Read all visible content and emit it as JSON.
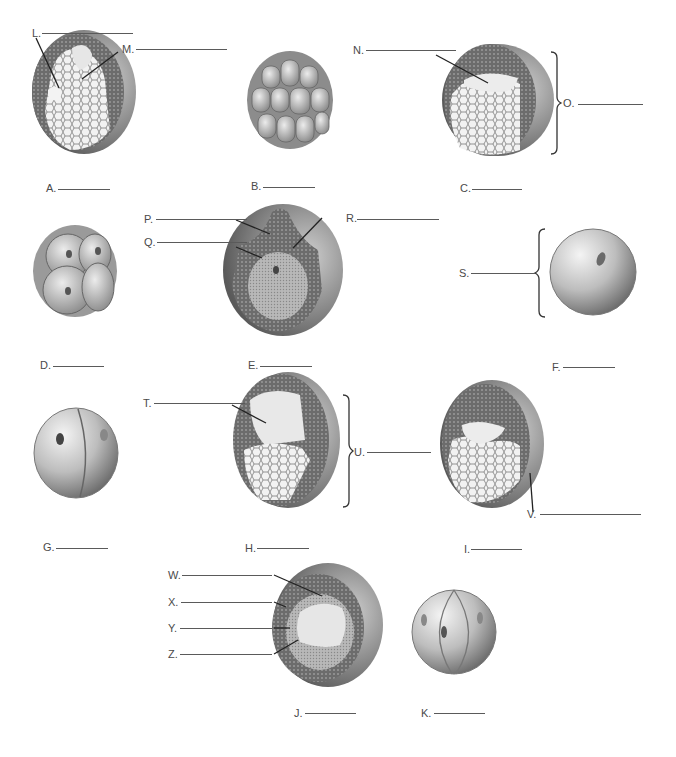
{
  "diagram": {
    "stage_labels": [
      {
        "id": "A",
        "text": "A."
      },
      {
        "id": "B",
        "text": "B."
      },
      {
        "id": "C",
        "text": "C."
      },
      {
        "id": "D",
        "text": "D."
      },
      {
        "id": "E",
        "text": "E."
      },
      {
        "id": "F",
        "text": "F."
      },
      {
        "id": "G",
        "text": "G."
      },
      {
        "id": "H",
        "text": "H."
      },
      {
        "id": "I",
        "text": "I."
      },
      {
        "id": "J",
        "text": "J."
      },
      {
        "id": "K",
        "text": "K."
      }
    ],
    "part_labels": [
      {
        "id": "L",
        "text": "L."
      },
      {
        "id": "M",
        "text": "M."
      },
      {
        "id": "N",
        "text": "N."
      },
      {
        "id": "O",
        "text": "O."
      },
      {
        "id": "P",
        "text": "P."
      },
      {
        "id": "Q",
        "text": "Q."
      },
      {
        "id": "R",
        "text": "R."
      },
      {
        "id": "S",
        "text": "S."
      },
      {
        "id": "T",
        "text": "T."
      },
      {
        "id": "U",
        "text": "U."
      },
      {
        "id": "V",
        "text": "V."
      },
      {
        "id": "W",
        "text": "W."
      },
      {
        "id": "X",
        "text": "X."
      },
      {
        "id": "Y",
        "text": "Y."
      },
      {
        "id": "Z",
        "text": "Z."
      }
    ],
    "illustrations": [
      {
        "stage": "A",
        "name": "gastrula-late"
      },
      {
        "stage": "B",
        "name": "morula"
      },
      {
        "stage": "C",
        "name": "blastula-section"
      },
      {
        "stage": "D",
        "name": "eight-cell-stage"
      },
      {
        "stage": "E",
        "name": "neurula-section"
      },
      {
        "stage": "F",
        "name": "zygote"
      },
      {
        "stage": "G",
        "name": "two-cell-stage"
      },
      {
        "stage": "H",
        "name": "early-gastrula-section"
      },
      {
        "stage": "I",
        "name": "gastrula-section"
      },
      {
        "stage": "J",
        "name": "late-neurula-section"
      },
      {
        "stage": "K",
        "name": "four-cell-stage"
      }
    ]
  }
}
